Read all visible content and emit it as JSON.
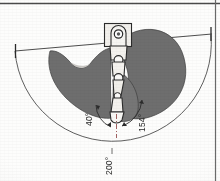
{
  "figure": {
    "type": "technical-line-drawing",
    "medium": "scanned grayscale print",
    "canvas": {
      "width": 220,
      "height": 181
    }
  },
  "colors": {
    "background": "#fdfdfc",
    "line": "#2b2b2b",
    "thin_line": "#6a6a6a",
    "envelope_fill": "#6e6e6e",
    "envelope_fill_light": "#8a8a8a",
    "body_fill": "#eceae6",
    "page_rule": "#4a4a4a"
  },
  "annotations": {
    "angles": [
      {
        "id": "angle-40",
        "value": 40,
        "label": "40°",
        "unit": "degree",
        "rotation_deg": -90,
        "describes": "inner swing sector at lower pivot, left side"
      },
      {
        "id": "angle-154",
        "value": 154,
        "label": "154°",
        "unit": "degree",
        "rotation_deg": -90,
        "describes": "intermediate working sector, right side"
      },
      {
        "id": "angle-200",
        "value": 200,
        "label": "200°",
        "unit": "degree",
        "rotation_deg": -90,
        "describes": "outer total swing envelope arc"
      }
    ]
  },
  "geometry": {
    "pivot": {
      "x": 116,
      "y": 122,
      "name": "lower-pivot-point"
    },
    "head_mount": {
      "x": 105,
      "y": 24,
      "w": 26,
      "h": 22,
      "name": "upper-bracket-housing"
    },
    "bore": {
      "x": 118,
      "y": 35,
      "r": 4,
      "name": "pivot-bore"
    },
    "chord_line": {
      "x1": 15,
      "y1": 51,
      "x2": 212,
      "y2": 34,
      "name": "horizontal-reference-chord"
    },
    "outer_arc_radius": 98,
    "centerline": {
      "x": 116,
      "y1": 118,
      "y2": 138
    }
  },
  "elements": {
    "page_rule_top": "top page rule",
    "page_rule_right": "right page rule",
    "left_tick": "left chord terminator tick",
    "right_tick": "right chord terminator tick",
    "arm_segments": 4,
    "joint_circles": 3
  }
}
